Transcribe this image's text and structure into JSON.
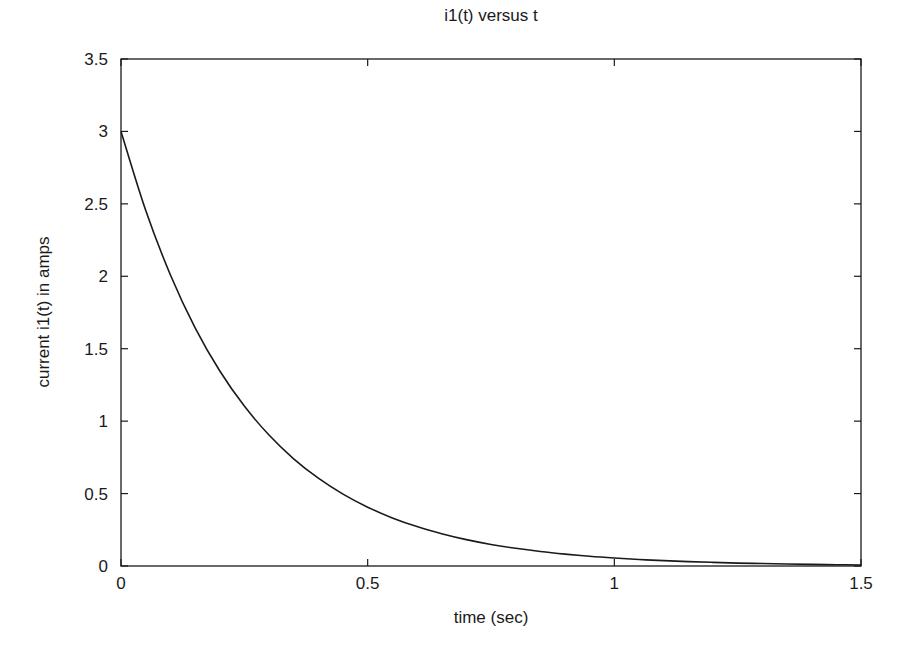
{
  "chart_data": {
    "type": "line",
    "title": "i1(t) versus t",
    "xlabel": "time (sec)",
    "ylabel": "current i1(t) in amps",
    "xlim": [
      0,
      1.5
    ],
    "ylim": [
      0,
      3.5
    ],
    "xticks": [
      0,
      0.5,
      1,
      1.5
    ],
    "xtick_labels": [
      "0",
      "0.5",
      "1",
      "1.5"
    ],
    "yticks": [
      0,
      0.5,
      1,
      1.5,
      2,
      2.5,
      3,
      3.5
    ],
    "ytick_labels": [
      "0",
      "0.5",
      "1",
      "1.5",
      "2",
      "2.5",
      "3",
      "3.5"
    ],
    "grid": false,
    "legend": null,
    "series": [
      {
        "name": "i1(t)",
        "color": "#1a1a1a",
        "x": [
          0,
          0.05,
          0.1,
          0.15,
          0.2,
          0.25,
          0.3,
          0.35,
          0.4,
          0.45,
          0.5,
          0.55,
          0.6,
          0.65,
          0.7,
          0.75,
          0.8,
          0.85,
          0.9,
          0.95,
          1.0,
          1.05,
          1.1,
          1.15,
          1.2,
          1.25,
          1.3,
          1.35,
          1.4,
          1.45,
          1.5
        ],
        "y": [
          3.0,
          2.456,
          2.011,
          1.646,
          1.348,
          1.104,
          0.904,
          0.74,
          0.606,
          0.496,
          0.406,
          0.332,
          0.272,
          0.223,
          0.182,
          0.149,
          0.122,
          0.1,
          0.082,
          0.067,
          0.055,
          0.045,
          0.037,
          0.03,
          0.025,
          0.02,
          0.017,
          0.014,
          0.011,
          0.009,
          0.007
        ]
      }
    ]
  },
  "layout": {
    "plot_left": 121,
    "plot_top": 59,
    "plot_right": 861,
    "plot_bottom": 566
  }
}
